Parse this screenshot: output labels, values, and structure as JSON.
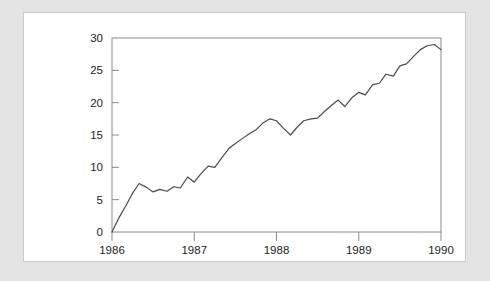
{
  "figure": {
    "panel_background": "#ffffff",
    "frame_background": "#e4e4e4",
    "frame_border_color": "#c9c9c9"
  },
  "chart_data": {
    "type": "line",
    "title": "",
    "subtitle": "",
    "xlabel": "",
    "ylabel": "",
    "xlim": [
      1986.0,
      1990.0
    ],
    "ylim": [
      0,
      30
    ],
    "grid": false,
    "legend": null,
    "axis_color": "#8a8a8a",
    "line_color": "#4a4a4a",
    "line_width": 1.2,
    "xticks": [
      1986,
      1987,
      1988,
      1989,
      1990
    ],
    "xtick_labels": [
      "1986",
      "1987",
      "1988",
      "1989",
      "1990"
    ],
    "yticks": [
      0,
      5,
      10,
      15,
      20,
      25,
      30
    ],
    "ytick_labels": [
      "0",
      "5",
      "10",
      "15",
      "20",
      "25",
      "30"
    ],
    "series": [
      {
        "name": "series-1",
        "x": [
          1986.0,
          1986.08,
          1986.17,
          1986.25,
          1986.33,
          1986.42,
          1986.5,
          1986.58,
          1986.67,
          1986.75,
          1986.83,
          1986.92,
          1987.0,
          1987.08,
          1987.17,
          1987.25,
          1987.33,
          1987.42,
          1987.5,
          1987.58,
          1987.67,
          1987.75,
          1987.83,
          1987.92,
          1988.0,
          1988.08,
          1988.17,
          1988.25,
          1988.33,
          1988.42,
          1988.5,
          1988.58,
          1988.67,
          1988.75,
          1988.83,
          1988.92,
          1989.0,
          1989.08,
          1989.17,
          1989.25,
          1989.33,
          1989.42,
          1989.5,
          1989.58,
          1989.67,
          1989.75,
          1989.83,
          1989.92,
          1990.0
        ],
        "y": [
          0.0,
          2.1,
          4.1,
          6.0,
          7.5,
          6.9,
          6.2,
          6.6,
          6.3,
          7.0,
          6.8,
          8.5,
          7.7,
          9.0,
          10.2,
          10.0,
          11.4,
          12.9,
          13.7,
          14.4,
          15.2,
          15.8,
          16.8,
          17.5,
          17.2,
          16.1,
          15.0,
          16.2,
          17.2,
          17.5,
          17.6,
          18.6,
          19.6,
          20.4,
          19.4,
          20.8,
          21.6,
          21.2,
          22.8,
          23.0,
          24.4,
          24.1,
          25.7,
          26.0,
          27.2,
          28.2,
          28.8,
          29.0,
          28.2
        ]
      }
    ]
  }
}
